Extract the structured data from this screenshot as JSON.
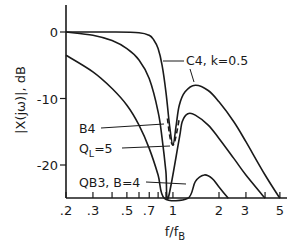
{
  "chart_data": {
    "type": "line",
    "title": "",
    "xlabel": "f/f_B",
    "ylabel": "|X(jω)|, dB",
    "xscale": "log",
    "xlim": [
      0.2,
      5.5
    ],
    "ylim": [
      -25,
      4
    ],
    "grid": false,
    "xticks": [
      0.2,
      0.3,
      0.4,
      0.5,
      0.6,
      0.7,
      0.8,
      0.9,
      1,
      2,
      3,
      4,
      5
    ],
    "xtick_labels": [
      ".2",
      ".3",
      ".5",
      ".7",
      "1",
      "2",
      "3",
      "5"
    ],
    "yticks": [
      0,
      -10,
      -20
    ],
    "ytick_labels": [
      "0",
      "-10",
      "-20"
    ],
    "annotations": [
      {
        "text": "C4, k=0.5"
      },
      {
        "text": "B4"
      },
      {
        "text": "Q",
        "sub": "L",
        "suffix": "=5"
      },
      {
        "text": "QB3, B=4"
      }
    ],
    "series": [
      {
        "name": "C4, k=0.5",
        "style": "solid",
        "x": [
          0.2,
          0.4,
          0.6,
          0.7,
          0.75,
          0.8,
          0.85,
          0.9,
          0.95,
          1.0,
          1.05,
          1.1,
          1.2,
          1.4,
          1.7,
          2.0,
          2.5,
          3.0,
          4.0,
          5.0
        ],
        "y": [
          0,
          0,
          -0.1,
          -0.5,
          -1.2,
          -2.5,
          -5,
          -9,
          -14,
          -17,
          -14,
          -11,
          -9,
          -8,
          -8.8,
          -10.5,
          -13.5,
          -16.5,
          -21.5,
          -25
        ]
      },
      {
        "name": "B4",
        "style": "solid",
        "x": [
          0.2,
          0.3,
          0.4,
          0.5,
          0.6,
          0.7,
          0.8,
          0.85,
          0.9,
          0.93,
          1.1,
          1.15,
          1.25,
          1.4,
          1.7,
          2.0,
          2.5,
          3.0,
          4.0
        ],
        "y": [
          0,
          -0.5,
          -1.3,
          -2.5,
          -4.2,
          -7,
          -12,
          -16,
          -21,
          -25,
          -16,
          -13.5,
          -12.3,
          -12.5,
          -14,
          -16,
          -19,
          -21.5,
          -25
        ]
      },
      {
        "name": "Q_L=5",
        "style": "dashed",
        "x": [
          0.92,
          0.96,
          1.0,
          1.04,
          1.1
        ],
        "y": [
          -13,
          -16,
          -17,
          -16,
          -13
        ]
      },
      {
        "name": "QB3, B=4",
        "style": "solid",
        "x": [
          0.2,
          0.3,
          0.4,
          0.5,
          0.6,
          0.7,
          0.8,
          0.88,
          1.25,
          1.4,
          1.6,
          1.8,
          2.0,
          2.3
        ],
        "y": [
          -3.5,
          -6,
          -8.5,
          -11,
          -14,
          -17.5,
          -21.5,
          -25,
          -25,
          -22.5,
          -21.5,
          -22,
          -23.3,
          -25
        ]
      }
    ]
  }
}
